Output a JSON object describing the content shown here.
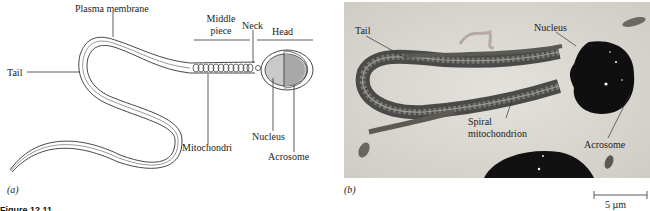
{
  "panel_a": {
    "label": "(a)",
    "labels": {
      "plasma_membrane": "Plasma membrane",
      "tail": "Tail",
      "middle_piece_line1": "Middle",
      "middle_piece_line2": "piece",
      "neck": "Neck",
      "head": "Head",
      "mitochondri": "Mitochondri",
      "nucleus": "Nucleus",
      "acrosome": "Acrosome"
    },
    "colors": {
      "nucleus_fill": "#c9c9c9",
      "acrosome_fill": "#a8a8a8",
      "line": "#333333"
    }
  },
  "panel_b": {
    "label": "(b)",
    "labels": {
      "tail": "Tail",
      "nucleus": "Nucleus",
      "spiral_line1": "Spiral",
      "spiral_line2": "mitochondrion",
      "acrosome": "Acrosome"
    },
    "scale_bar": {
      "value": "5 µm"
    }
  },
  "caption": {
    "text": "Figure 12.11"
  }
}
